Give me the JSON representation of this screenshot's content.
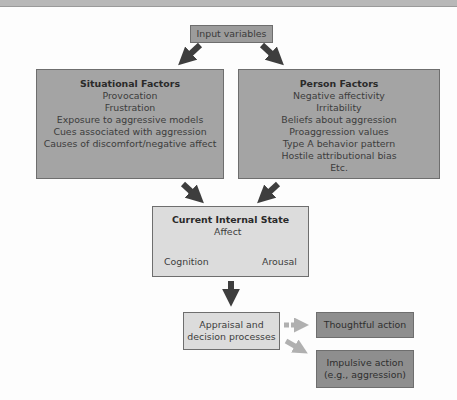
{
  "diagram": {
    "input": {
      "label": "Input variables"
    },
    "situational": {
      "title": "Situational Factors",
      "items": [
        "Provocation",
        "Frustration",
        "Exposure to aggressive models",
        "Cues associated with aggression",
        "Causes of discomfort/negative affect"
      ]
    },
    "person": {
      "title": "Person Factors",
      "items": [
        "Negative affectivity",
        "Irritability",
        "Beliefs about aggression",
        "Proaggression values",
        "Type A behavior pattern",
        "Hostile attributional bias",
        "Etc."
      ]
    },
    "internal_state": {
      "title": "Current Internal State",
      "affect": "Affect",
      "cognition": "Cognition",
      "arousal": "Arousal"
    },
    "appraisal": {
      "line1": "Appraisal and",
      "line2": "decision processes"
    },
    "outcomes": {
      "thoughtful": "Thoughtful action",
      "impulsive_line1": "Impulsive action",
      "impulsive_line2": "(e.g., aggression)"
    },
    "colors": {
      "dark_box": "#a4a4a4",
      "light_box": "#dcdcdc",
      "output_box": "#8e8e8e",
      "arrow_dark": "#3e3e3e",
      "arrow_light": "#b0b0b0"
    }
  }
}
